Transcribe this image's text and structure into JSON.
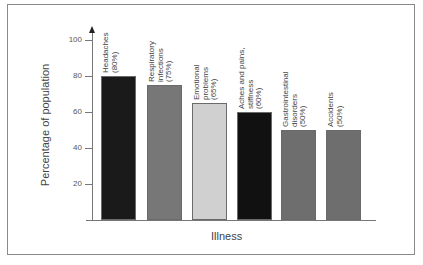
{
  "chart_data": {
    "type": "bar",
    "title": "",
    "xlabel": "Illness",
    "ylabel": "Percentage of population",
    "ylim": [
      0,
      100
    ],
    "yticks": [
      20,
      40,
      60,
      80,
      100
    ],
    "grid": false,
    "categories": [
      "Headaches",
      "Respiratory infections",
      "Emotional problems",
      "Aches and pains, stiffness",
      "Gastrointestinal disorders",
      "Accidents"
    ],
    "values": [
      80,
      75,
      65,
      60,
      50,
      50
    ],
    "bar_labels": [
      [
        "Headaches",
        "(80%)"
      ],
      [
        "Respiratory",
        "infections",
        "(75%)"
      ],
      [
        "Emotional",
        "problems",
        "(65%)"
      ],
      [
        "Aches and pains,",
        "stiffness",
        "(60%)"
      ],
      [
        "Gastrointestinal",
        "disorders",
        "(50%)"
      ],
      [
        "Accidents",
        "(50%)"
      ]
    ],
    "bar_colors": [
      "#1a1a1a",
      "#777777",
      "#d0d0d0",
      "#111111",
      "#6e6e6e",
      "#6e6e6e"
    ]
  }
}
